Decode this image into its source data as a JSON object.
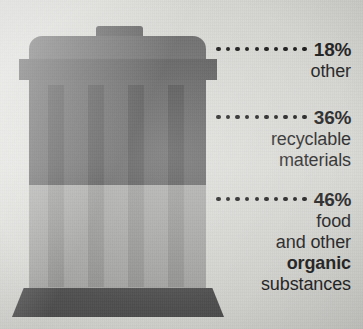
{
  "chart_data": {
    "type": "pie",
    "unit": "%",
    "categories": [
      "other",
      "recyclable materials",
      "food and other organic substances"
    ],
    "values": [
      18,
      46,
      36
    ],
    "series": [
      {
        "name": "waste composition",
        "values": [
          18,
          36,
          46
        ]
      }
    ],
    "annotations": [
      "18% other",
      "36% recyclable materials",
      "46% food and other organic substances"
    ],
    "xlabel": "",
    "ylabel": "",
    "legend_position": "right",
    "grid": false
  },
  "illustration": {
    "name": "trash-bin",
    "parts": [
      "lid-knob",
      "lid-top",
      "rim",
      "body-upper",
      "body-lower",
      "ribs",
      "base"
    ],
    "rib_positions": [
      48,
      88,
      128,
      168
    ],
    "colors": {
      "background": "#dcdcd8",
      "lid": "#6a6a6a",
      "knob": "#5e5e5e",
      "rim": "#5a5a5a",
      "body_upper": "#5c5c5c",
      "body_lower": "#a9a9a7",
      "rib_upper": "#4b4b4b",
      "rib_lower": "#979795",
      "base": "#4f4f4f",
      "text": "#1c1c1c"
    }
  },
  "callouts": [
    {
      "id": "other",
      "percent": "18%",
      "dots": 10,
      "lines": [
        {
          "text": "other",
          "bold": false
        }
      ]
    },
    {
      "id": "recyclable",
      "percent": "36%",
      "dots": 10,
      "lines": [
        {
          "text": "recyclable",
          "bold": false
        },
        {
          "text": "materials",
          "bold": false
        }
      ]
    },
    {
      "id": "organic",
      "percent": "46%",
      "dots": 10,
      "lines": [
        {
          "text": "food",
          "bold": false
        },
        {
          "text": "and other",
          "bold": false
        },
        {
          "text": "organic",
          "bold": true
        },
        {
          "text": "substances",
          "bold": false
        }
      ]
    }
  ]
}
